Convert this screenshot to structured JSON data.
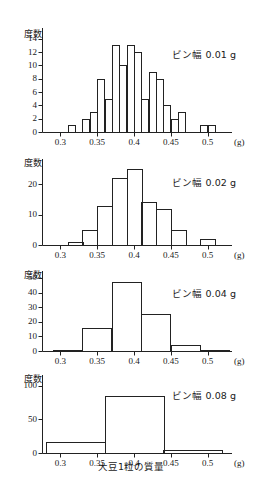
{
  "figure": {
    "axis_title_bottom": "大豆1粒の質量",
    "y_axis_label": "度数",
    "x_unit": "(g)"
  },
  "chart_data": [
    {
      "type": "bar",
      "title": "ビン幅 0.01 g",
      "bin_width": 0.01,
      "xlabel": "大豆1粒の質量",
      "ylabel": "度数",
      "xunit": "(g)",
      "xlim": [
        0.275,
        0.525
      ],
      "ylim": [
        0,
        15
      ],
      "xticks": [
        0.3,
        0.35,
        0.4,
        0.45,
        0.5
      ],
      "xtick_labels": [
        "0.3",
        "0.35",
        "0.4",
        "0.45",
        "0.5"
      ],
      "yticks": [
        0,
        2,
        4,
        6,
        8,
        10,
        12,
        14
      ],
      "ytick_labels": [
        "0",
        "2",
        "4",
        "6",
        "8",
        "10",
        "12",
        "14"
      ],
      "bin_starts": [
        0.31,
        0.33,
        0.34,
        0.35,
        0.36,
        0.37,
        0.38,
        0.39,
        0.4,
        0.41,
        0.42,
        0.43,
        0.44,
        0.45,
        0.46,
        0.49,
        0.5
      ],
      "values": [
        1,
        2,
        3,
        8,
        5,
        13,
        10,
        13,
        12,
        5,
        9,
        8,
        4,
        2,
        3,
        1,
        1
      ],
      "grid": false,
      "legend": "none"
    },
    {
      "type": "bar",
      "title": "ビン幅 0.02 g",
      "bin_width": 0.02,
      "xlabel": "大豆1粒の質量",
      "ylabel": "度数",
      "xunit": "(g)",
      "xlim": [
        0.275,
        0.525
      ],
      "ylim": [
        0,
        27
      ],
      "xticks": [
        0.3,
        0.35,
        0.4,
        0.45,
        0.5
      ],
      "xtick_labels": [
        "0.3",
        "0.35",
        "0.4",
        "0.45",
        "0.5"
      ],
      "yticks": [
        0,
        10,
        20
      ],
      "ytick_labels": [
        "0",
        "10",
        "20"
      ],
      "bin_starts": [
        0.31,
        0.33,
        0.35,
        0.37,
        0.39,
        0.41,
        0.43,
        0.45,
        0.47,
        0.49
      ],
      "values": [
        1,
        5,
        13,
        22,
        25,
        14,
        12,
        5,
        0,
        2
      ],
      "grid": false,
      "legend": "none"
    },
    {
      "type": "bar",
      "title": "ビン幅 0.04 g",
      "bin_width": 0.04,
      "xlabel": "大豆1粒の質量",
      "ylabel": "度数",
      "xunit": "(g)",
      "xlim": [
        0.275,
        0.525
      ],
      "ylim": [
        0,
        52
      ],
      "xticks": [
        0.3,
        0.35,
        0.4,
        0.45,
        0.5
      ],
      "xtick_labels": [
        "0.3",
        "0.35",
        "0.4",
        "0.45",
        "0.5"
      ],
      "yticks": [
        0,
        10,
        20,
        30,
        40,
        50
      ],
      "ytick_labels": [
        "0",
        "10",
        "20",
        "30",
        "40",
        "50"
      ],
      "bin_starts": [
        0.29,
        0.33,
        0.37,
        0.41,
        0.45,
        0.49
      ],
      "values": [
        1,
        16,
        47,
        25,
        4,
        1
      ],
      "grid": false,
      "legend": "none"
    },
    {
      "type": "bar",
      "title": "ビン幅 0.08 g",
      "bin_width": 0.08,
      "xlabel": "大豆1粒の質量",
      "ylabel": "度数",
      "xunit": "(g)",
      "xlim": [
        0.275,
        0.525
      ],
      "ylim": [
        0,
        110
      ],
      "xticks": [
        0.3,
        0.35,
        0.4,
        0.45,
        0.5
      ],
      "xtick_labels": [
        "0.3",
        "0.35",
        "0.4",
        "0.45",
        "0.5"
      ],
      "yticks": [
        0,
        50,
        100
      ],
      "ytick_labels": [
        "0",
        "50",
        "100"
      ],
      "bin_starts": [
        0.28,
        0.36,
        0.44
      ],
      "values": [
        17,
        85,
        5
      ],
      "grid": false,
      "legend": "none"
    }
  ]
}
